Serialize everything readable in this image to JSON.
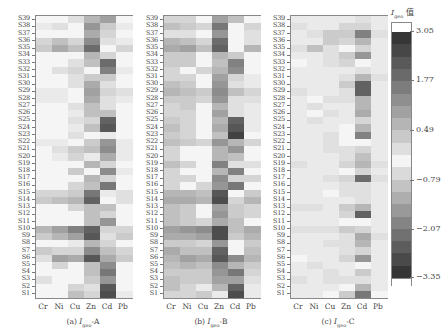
{
  "chart_data": {
    "type": "heatmap",
    "title": "",
    "colorbar": {
      "title": "I_geo 值",
      "ticks": [
        "3.05",
        "1.77",
        "0.49",
        "-0.79",
        "-2.07",
        "-3.35"
      ],
      "range": [
        -3.35,
        3.05
      ]
    },
    "x_categories": [
      "Cr",
      "Ni",
      "Cu",
      "Zn",
      "Cd",
      "Pb"
    ],
    "y_categories": [
      "S39",
      "S38",
      "S37",
      "S36",
      "S35",
      "S34",
      "S33",
      "S32",
      "S31",
      "S30",
      "S29",
      "S28",
      "S27",
      "S26",
      "S25",
      "S24",
      "S23",
      "S22",
      "S21",
      "S20",
      "S19",
      "S18",
      "S17",
      "S16",
      "S15",
      "S14",
      "S13",
      "S12",
      "S11",
      "S10",
      "S9",
      "S8",
      "S7",
      "S6",
      "S5",
      "S4",
      "S3",
      "S2",
      "S1"
    ],
    "panels": [
      {
        "caption": "(a) I_geo-A",
        "intensity_note": "values are grayscale darkness 0-1 estimated from pixels (top row S39 to bottom row S1)",
        "darkness": [
          [
            0.05,
            0.05,
            0.15,
            0.35,
            0.45,
            0.05
          ],
          [
            0.1,
            0.15,
            0.05,
            0.5,
            0.25,
            0.1
          ],
          [
            0.05,
            0.05,
            0.05,
            0.4,
            0.2,
            0.05
          ],
          [
            0.2,
            0.3,
            0.2,
            0.55,
            0.15,
            0.1
          ],
          [
            0.25,
            0.4,
            0.3,
            0.7,
            0.05,
            0.2
          ],
          [
            0.05,
            0.05,
            0.05,
            0.35,
            0.2,
            0.05
          ],
          [
            0.05,
            0.05,
            0.15,
            0.3,
            0.7,
            0.05
          ],
          [
            0.05,
            0.15,
            0.2,
            0.05,
            0.6,
            0.1
          ],
          [
            0.05,
            0.05,
            0.15,
            0.25,
            0.25,
            0.05
          ],
          [
            0.05,
            0.05,
            0.15,
            0.4,
            0.15,
            0.05
          ],
          [
            0.1,
            0.1,
            0.05,
            0.45,
            0.2,
            0.15
          ],
          [
            0.1,
            0.1,
            0.05,
            0.4,
            0.15,
            0.1
          ],
          [
            0.05,
            0.05,
            0.15,
            0.3,
            0.15,
            0.05
          ],
          [
            0.05,
            0.05,
            0.1,
            0.3,
            0.3,
            0.05
          ],
          [
            0.05,
            0.05,
            0.15,
            0.2,
            0.75,
            0.05
          ],
          [
            0.05,
            0.05,
            0.1,
            0.3,
            0.8,
            0.05
          ],
          [
            0.05,
            0.05,
            0.15,
            0.05,
            0.1,
            0.05
          ],
          [
            0.1,
            0.1,
            0.05,
            0.25,
            0.5,
            0.1
          ],
          [
            0.05,
            0.15,
            0.25,
            0.3,
            0.55,
            0.1
          ],
          [
            0.05,
            0.1,
            0.2,
            0.1,
            0.4,
            0.1
          ],
          [
            0.05,
            0.05,
            0.05,
            0.35,
            0.2,
            0.05
          ],
          [
            0.05,
            0.05,
            0.25,
            0.05,
            0.55,
            0.1
          ],
          [
            0.05,
            0.05,
            0.05,
            0.35,
            0.2,
            0.05
          ],
          [
            0.05,
            0.05,
            0.2,
            0.3,
            0.65,
            0.05
          ],
          [
            0.2,
            0.2,
            0.25,
            0.65,
            0.1,
            0.15
          ],
          [
            0.25,
            0.3,
            0.35,
            0.75,
            0.05,
            0.15
          ],
          [
            0.05,
            0.05,
            0.2,
            0.3,
            0.3,
            0.05
          ],
          [
            0.05,
            0.05,
            0.05,
            0.3,
            0.2,
            0.05
          ],
          [
            0.05,
            0.05,
            0.05,
            0.3,
            0.5,
            0.05
          ],
          [
            0.35,
            0.45,
            0.6,
            0.75,
            0.2,
            0.2
          ],
          [
            0.25,
            0.35,
            0.45,
            0.8,
            0.15,
            0.25
          ],
          [
            0.05,
            0.05,
            0.1,
            0.35,
            0.2,
            0.05
          ],
          [
            0.25,
            0.2,
            0.2,
            0.55,
            0.3,
            0.2
          ],
          [
            0.15,
            0.45,
            0.4,
            0.8,
            0.4,
            0.25
          ],
          [
            0.05,
            0.2,
            0.05,
            0.3,
            0.55,
            0.05
          ],
          [
            0.05,
            0.05,
            0.05,
            0.3,
            0.65,
            0.05
          ],
          [
            0.15,
            0.05,
            0.05,
            0.25,
            0.5,
            0.05
          ],
          [
            0.05,
            0.05,
            0.2,
            0.15,
            0.8,
            0.05
          ],
          [
            0.05,
            0.05,
            0.3,
            0.2,
            0.85,
            0.1
          ]
        ]
      },
      {
        "caption": "(b) I_geo-B",
        "darkness": [
          [
            0.2,
            0.2,
            0.05,
            0.45,
            0.3,
            0.05
          ],
          [
            0.3,
            0.25,
            0.2,
            0.65,
            0.05,
            0.2
          ],
          [
            0.15,
            0.15,
            0.05,
            0.5,
            0.05,
            0.15
          ],
          [
            0.35,
            0.3,
            0.2,
            0.7,
            0.05,
            0.15
          ],
          [
            0.4,
            0.45,
            0.3,
            0.75,
            0.05,
            0.35
          ],
          [
            0.25,
            0.25,
            0.05,
            0.35,
            0.25,
            0.05
          ],
          [
            0.25,
            0.25,
            0.05,
            0.3,
            0.6,
            0.05
          ],
          [
            0.2,
            0.05,
            0.2,
            0.35,
            0.55,
            0.05
          ],
          [
            0.2,
            0.2,
            0.05,
            0.45,
            0.2,
            0.1
          ],
          [
            0.3,
            0.25,
            0.05,
            0.5,
            0.15,
            0.1
          ],
          [
            0.35,
            0.3,
            0.25,
            0.55,
            0.3,
            0.2
          ],
          [
            0.25,
            0.25,
            0.2,
            0.5,
            0.15,
            0.15
          ],
          [
            0.2,
            0.25,
            0.05,
            0.35,
            0.15,
            0.1
          ],
          [
            0.2,
            0.2,
            0.05,
            0.45,
            0.15,
            0.1
          ],
          [
            0.25,
            0.2,
            0.05,
            0.35,
            0.75,
            0.1
          ],
          [
            0.3,
            0.2,
            0.05,
            0.4,
            0.8,
            0.1
          ],
          [
            0.25,
            0.2,
            0.05,
            0.3,
            0.9,
            0.05
          ],
          [
            0.3,
            0.25,
            0.2,
            0.5,
            0.35,
            0.2
          ],
          [
            0.2,
            0.05,
            0.05,
            0.35,
            0.5,
            0.05
          ],
          [
            0.2,
            0.05,
            0.05,
            0.35,
            0.3,
            0.05
          ],
          [
            0.3,
            0.2,
            0.05,
            0.6,
            0.15,
            0.15
          ],
          [
            0.2,
            0.05,
            0.05,
            0.35,
            0.6,
            0.05
          ],
          [
            0.2,
            0.2,
            0.05,
            0.55,
            0.2,
            0.2
          ],
          [
            0.2,
            0.05,
            0.2,
            0.5,
            0.65,
            0.05
          ],
          [
            0.35,
            0.35,
            0.3,
            0.8,
            0.05,
            0.25
          ],
          [
            0.4,
            0.4,
            0.35,
            0.85,
            0.2,
            0.35
          ],
          [
            0.3,
            0.25,
            0.05,
            0.45,
            0.25,
            0.2
          ],
          [
            0.3,
            0.25,
            0.05,
            0.5,
            0.25,
            0.2
          ],
          [
            0.3,
            0.25,
            0.2,
            0.4,
            0.3,
            0.05
          ],
          [
            0.45,
            0.5,
            0.55,
            0.85,
            0.3,
            0.4
          ],
          [
            0.4,
            0.4,
            0.45,
            0.85,
            0.25,
            0.35
          ],
          [
            0.25,
            0.25,
            0.2,
            0.5,
            0.05,
            0.25
          ],
          [
            0.4,
            0.3,
            0.3,
            0.75,
            0.05,
            0.3
          ],
          [
            0.35,
            0.45,
            0.4,
            0.8,
            0.55,
            0.35
          ],
          [
            0.3,
            0.35,
            0.3,
            0.55,
            0.35,
            0.25
          ],
          [
            0.25,
            0.25,
            0.25,
            0.5,
            0.65,
            0.2
          ],
          [
            0.3,
            0.25,
            0.25,
            0.45,
            0.45,
            0.15
          ],
          [
            0.3,
            0.2,
            0.1,
            0.35,
            0.75,
            0.1
          ],
          [
            0.2,
            0.2,
            0.25,
            0.1,
            0.85,
            0.1
          ]
        ]
      },
      {
        "caption": "(c) I_geo-C",
        "darkness": [
          [
            0.1,
            0.1,
            0.1,
            0.1,
            0.15,
            0.1
          ],
          [
            0.15,
            0.1,
            0.1,
            0.2,
            0.2,
            0.1
          ],
          [
            0.1,
            0.15,
            0.25,
            0.25,
            0.6,
            0.15
          ],
          [
            0.1,
            0.1,
            0.25,
            0.2,
            0.35,
            0.1
          ],
          [
            0.15,
            0.3,
            0.15,
            0.05,
            0.2,
            0.1
          ],
          [
            0.1,
            0.1,
            0.15,
            0.25,
            0.5,
            0.1
          ],
          [
            0.05,
            0.1,
            0.15,
            0.2,
            0.05,
            0.1
          ],
          [
            0.1,
            0.1,
            0.1,
            0.1,
            0.15,
            0.1
          ],
          [
            0.1,
            0.1,
            0.1,
            0.15,
            0.35,
            0.15
          ],
          [
            0.1,
            0.1,
            0.1,
            0.25,
            0.75,
            0.1
          ],
          [
            0.15,
            0.1,
            0.1,
            0.15,
            0.75,
            0.1
          ],
          [
            0.1,
            0.05,
            0.15,
            0.15,
            0.35,
            0.1
          ],
          [
            0.1,
            0.15,
            0.1,
            0.1,
            0.35,
            0.1
          ],
          [
            0.1,
            0.05,
            0.15,
            0.1,
            0.4,
            0.1
          ],
          [
            0.1,
            0.15,
            0.1,
            0.1,
            0.2,
            0.1
          ],
          [
            0.1,
            0.1,
            0.1,
            0.05,
            0.35,
            0.1
          ],
          [
            0.1,
            0.1,
            0.15,
            0.05,
            0.6,
            0.1
          ],
          [
            0.1,
            0.1,
            0.15,
            0.05,
            0.05,
            0.1
          ],
          [
            0.1,
            0.1,
            0.15,
            0.15,
            0.2,
            0.1
          ],
          [
            0.1,
            0.1,
            0.1,
            0.15,
            0.3,
            0.1
          ],
          [
            0.15,
            0.1,
            0.1,
            0.2,
            0.35,
            0.15
          ],
          [
            0.1,
            0.1,
            0.1,
            0.05,
            0.2,
            0.1
          ],
          [
            0.1,
            0.1,
            0.15,
            0.2,
            0.7,
            0.15
          ],
          [
            0.1,
            0.1,
            0.1,
            0.15,
            0.15,
            0.1
          ],
          [
            0.1,
            0.1,
            0.05,
            0.15,
            0.15,
            0.1
          ],
          [
            0.1,
            0.1,
            0.1,
            0.1,
            0.15,
            0.1
          ],
          [
            0.15,
            0.15,
            0.1,
            0.25,
            0.35,
            0.1
          ],
          [
            0.1,
            0.1,
            0.1,
            0.2,
            0.75,
            0.1
          ],
          [
            0.1,
            0.1,
            0.1,
            0.05,
            0.05,
            0.1
          ],
          [
            0.15,
            0.15,
            0.15,
            0.25,
            0.2,
            0.1
          ],
          [
            0.1,
            0.1,
            0.1,
            0.15,
            0.4,
            0.15
          ],
          [
            0.1,
            0.1,
            0.15,
            0.15,
            0.35,
            0.1
          ],
          [
            0.1,
            0.1,
            0.1,
            0.15,
            0.2,
            0.1
          ],
          [
            0.05,
            0.1,
            0.1,
            0.2,
            0.5,
            0.1
          ],
          [
            0.1,
            0.15,
            0.1,
            0.1,
            0.05,
            0.1
          ],
          [
            0.1,
            0.1,
            0.15,
            0.1,
            0.25,
            0.1
          ],
          [
            0.15,
            0.1,
            0.15,
            0.15,
            0.15,
            0.1
          ],
          [
            0.1,
            0.1,
            0.1,
            0.05,
            0.35,
            0.1
          ],
          [
            0.1,
            0.1,
            0.05,
            0.25,
            0.65,
            0.05
          ]
        ]
      }
    ]
  },
  "figure": {
    "panels": [
      {
        "caption_prefix": "(a)",
        "caption_var": "I",
        "caption_sub": "geo",
        "caption_suffix": "-A"
      },
      {
        "caption_prefix": "(b)",
        "caption_var": "I",
        "caption_sub": "geo",
        "caption_suffix": "-B"
      },
      {
        "caption_prefix": "(c)",
        "caption_var": "I",
        "caption_sub": "geo",
        "caption_suffix": "-C"
      }
    ],
    "colorbar_title_var": "I",
    "colorbar_title_sub": "geo",
    "colorbar_title_suffix": "值"
  }
}
